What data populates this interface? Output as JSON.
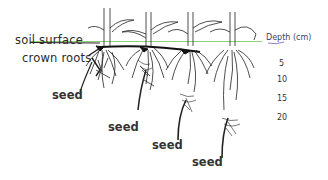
{
  "diagram": {
    "type": "corn seedling planting depth diagram",
    "labels": {
      "soil_surface": "soil surface",
      "crown_roots": "crown roots",
      "depth_title": "Depth (cm)"
    },
    "depth_scale": [
      "5",
      "10",
      "15",
      "20"
    ],
    "seeds": [
      {
        "label": "seed",
        "depth_cm": "5"
      },
      {
        "label": "seed",
        "depth_cm": "10"
      },
      {
        "label": "seed",
        "depth_cm": "15"
      },
      {
        "label": "seed",
        "depth_cm": "20"
      }
    ],
    "colors": {
      "soil_line": "#8fd07a",
      "ink": "#1a1a1a",
      "depth_underline": "#7a5bc0"
    }
  }
}
